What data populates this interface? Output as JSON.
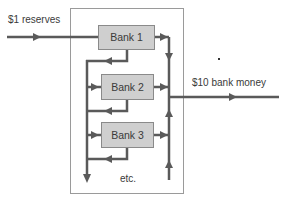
{
  "diagram": {
    "input_label": "$1 reserves",
    "output_label": "$10 bank money",
    "footer_label": "etc.",
    "banks": [
      {
        "label": "Bank 1"
      },
      {
        "label": "Bank 2"
      },
      {
        "label": "Bank 3"
      }
    ],
    "colors": {
      "line": "#5a5a5a",
      "bank_fill": "#cfcfcf",
      "bank_border": "#8a8a8a",
      "frame": "#9a9a9a",
      "text": "#3a3a3a"
    }
  }
}
